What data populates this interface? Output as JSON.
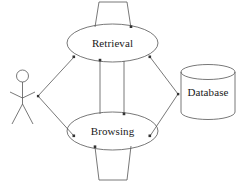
{
  "diagram": {
    "type": "uml-use-case-diagram",
    "stroke_color": "#555555",
    "label_color": "#1a1a1a",
    "background_color": "#ffffff",
    "nodes": [
      {
        "id": "actor",
        "shape": "stick-figure",
        "label": "",
        "x": 22,
        "y": 95
      },
      {
        "id": "retrieval",
        "shape": "ellipse",
        "label": "Retrieval",
        "cx": 112,
        "cy": 43,
        "rx": 45,
        "ry": 19
      },
      {
        "id": "browsing",
        "shape": "ellipse",
        "label": "Browsing",
        "cx": 112,
        "cy": 131,
        "rx": 45,
        "ry": 19
      },
      {
        "id": "database",
        "shape": "cylinder",
        "label": "Database",
        "x": 181,
        "y": 65,
        "width": 54,
        "height": 55
      }
    ],
    "edges": [
      {
        "from": "actor",
        "to": "retrieval",
        "style": "solid"
      },
      {
        "from": "actor",
        "to": "browsing",
        "style": "solid"
      },
      {
        "from": "retrieval",
        "to": "database",
        "style": "solid"
      },
      {
        "from": "browsing",
        "to": "database",
        "style": "solid"
      },
      {
        "from": "retrieval",
        "to": "browsing",
        "style": "solid"
      },
      {
        "from": "browsing",
        "to": "retrieval",
        "style": "solid"
      },
      {
        "from": "retrieval",
        "to": "retrieval",
        "style": "self-loop-top"
      },
      {
        "from": "browsing",
        "to": "browsing",
        "style": "self-loop-bottom"
      }
    ]
  },
  "labels": {
    "retrieval": "Retrieval",
    "browsing": "Browsing",
    "database": "Database"
  }
}
